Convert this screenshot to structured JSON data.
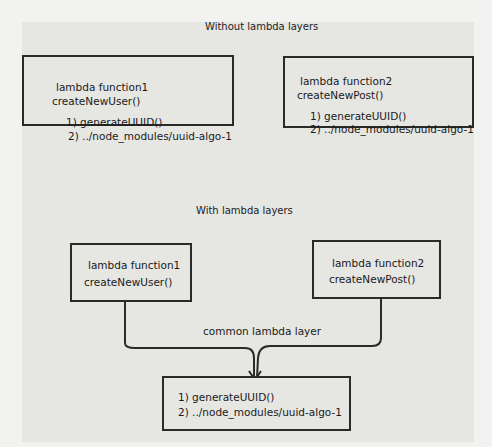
{
  "top_section": {
    "title": "Without lambda layers",
    "function1": {
      "name": "lambda function1",
      "handler": "createNewUser()",
      "item1": "1) generateUUID()",
      "item2": "2) ../node_modules/uuid-algo-1"
    },
    "function2": {
      "name": "lambda function2",
      "handler": "createNewPost()",
      "item1": "1) generateUUID()",
      "item2": "2) ../node_modules/uuid-algo-1"
    }
  },
  "bottom_section": {
    "title": "With lambda layers",
    "function1": {
      "name": "lambda function1",
      "handler": "createNewUser()"
    },
    "function2": {
      "name": "lambda function2",
      "handler": "createNewPost()"
    },
    "connector_label": "common lambda layer",
    "layer": {
      "item1": "1) generateUUID()",
      "item2": "2) ../node_modules/uuid-algo-1"
    }
  }
}
